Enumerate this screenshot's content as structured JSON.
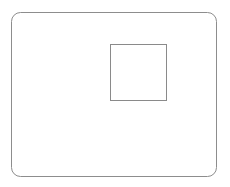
{
  "canvas": {
    "width": 230,
    "height": 187,
    "background_color": "#ffffff",
    "title": "Nested rectangles line drawing"
  },
  "style": {
    "stroke_color": "#8d8d8d",
    "inner_stroke_color": "#8a8a8a",
    "fill_color": "#ffffff",
    "stroke_width": 1
  },
  "shapes": [
    {
      "name": "outer-rounded-rectangle",
      "type": "rounded-rectangle",
      "x": 11,
      "y": 12,
      "width": 206,
      "height": 165,
      "corner_radius": 9,
      "stroke": "#8d8d8d",
      "fill": "#ffffff",
      "stroke_width": 1,
      "label": ""
    },
    {
      "name": "inner-square",
      "type": "rectangle",
      "x": 110,
      "y": 44,
      "width": 57,
      "height": 57,
      "corner_radius": 0,
      "stroke": "#8a8a8a",
      "fill": "#ffffff",
      "stroke_width": 1,
      "label": ""
    }
  ],
  "labels": {
    "outer_label": "",
    "inner_label": ""
  }
}
